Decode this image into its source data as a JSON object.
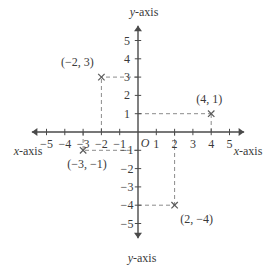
{
  "chart_data": {
    "type": "scatter",
    "title": "",
    "xlabel": "x-axis",
    "ylabel": "y-axis",
    "xlim": [
      -5.8,
      5.8
    ],
    "ylim": [
      -5.8,
      5.8
    ],
    "grid": false,
    "origin_label": "O",
    "x_ticks": [
      -5,
      -4,
      -3,
      -2,
      -1,
      1,
      2,
      3,
      4,
      5
    ],
    "y_ticks": [
      5,
      4,
      3,
      2,
      1,
      -1,
      -2,
      -3,
      -4,
      -5
    ],
    "x_tick_labels": [
      "−5",
      "−4",
      "−3",
      "−2",
      "−1",
      "1",
      "2",
      "3",
      "4",
      "5"
    ],
    "y_tick_labels": [
      "5",
      "4",
      "3",
      "2",
      "1",
      "−1",
      "−2",
      "−3",
      "−4",
      "−5"
    ],
    "points": [
      {
        "x": -2,
        "y": 3,
        "label": "(−2, 3)",
        "label_dx": -24,
        "label_dy": -15,
        "marker": "x"
      },
      {
        "x": 4,
        "y": 1,
        "label": "(4, 1)",
        "label_dx": -2,
        "label_dy": -15,
        "marker": "x"
      },
      {
        "x": -3,
        "y": -1,
        "label": "(−3, −1)",
        "label_dx": 4,
        "label_dy": 14,
        "marker": "x"
      },
      {
        "x": 2,
        "y": -4,
        "label": "(2, −4)",
        "label_dx": 22,
        "label_dy": 14,
        "marker": "x"
      }
    ],
    "axis_names": {
      "x_left": "x-axis",
      "x_right": "x-axis",
      "y_top": "y-axis",
      "y_bottom": "y-axis"
    },
    "colors": {
      "axis": "#4a4a4a",
      "dashed": "#8c8c8c",
      "marker": "#5a5a5a",
      "text": "#3a3a3a",
      "background": "#ffffff"
    }
  },
  "geometry": {
    "origin_x": 138,
    "origin_y": 132,
    "unit": 18.3
  }
}
